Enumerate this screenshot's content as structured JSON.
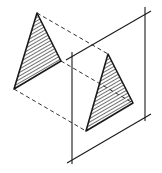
{
  "diagram": {
    "title": "",
    "colors": {
      "ink": "#1a1a1a",
      "background": "#ffffff"
    },
    "source_triangle": {
      "points": [
        [
          37,
          13
        ],
        [
          61,
          61
        ],
        [
          14,
          89
        ]
      ]
    },
    "projected_triangle": {
      "points": [
        [
          108,
          54
        ],
        [
          133,
          103
        ],
        [
          86,
          131
        ]
      ]
    },
    "projection_lines": [
      {
        "from": [
          37,
          13
        ],
        "to": [
          108,
          54
        ]
      },
      {
        "from": [
          61,
          61
        ],
        "to": [
          133,
          103
        ]
      },
      {
        "from": [
          14,
          89
        ],
        "to": [
          86,
          131
        ]
      }
    ],
    "plane": {
      "left_edge": {
        "from": [
          72,
          52
        ],
        "to": [
          72,
          164
        ]
      },
      "right_edge": {
        "from": [
          145,
          7
        ],
        "to": [
          145,
          121
        ]
      },
      "top_edge": {
        "from": [
          66,
          60
        ],
        "to": [
          151,
          11
        ]
      },
      "bottom_edge": {
        "from": [
          67,
          163
        ],
        "to": [
          151,
          114
        ]
      }
    }
  }
}
